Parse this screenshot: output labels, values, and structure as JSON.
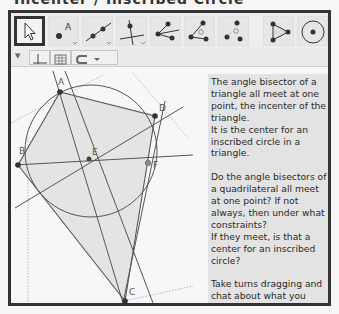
{
  "title": "Incenter / Inscribed Circle",
  "toolbar": {
    "tools": [
      {
        "name": "move-tool",
        "selected": true
      },
      {
        "name": "point-tool",
        "label": "A"
      },
      {
        "name": "line-tool"
      },
      {
        "name": "perpendicular-line-tool"
      },
      {
        "name": "segment-from-point-tool"
      },
      {
        "name": "angle-bisector-tool"
      },
      {
        "name": "angle-tool"
      },
      {
        "name": "polygon-tool"
      },
      {
        "name": "circle-tool"
      }
    ]
  },
  "stylebar": {
    "buttons": [
      "axes-toggle",
      "grid-toggle",
      "point-capture-dropdown"
    ]
  },
  "graphics": {
    "points": [
      {
        "label": "A"
      },
      {
        "label": "B"
      },
      {
        "label": "C"
      },
      {
        "label": "D"
      },
      {
        "label": "E"
      },
      {
        "label": "F"
      }
    ]
  },
  "textbox": {
    "paragraph1": "The angle bisector of a triangle all meet at one point, the incenter of the triangle.\nIt is the center for an inscribed circle in a triangle.",
    "paragraph2": "Do the angle bisectors of a quadrilateral all meet at one point? If not always, then under what constraints?\nIf they meet, is that a center for an inscribed circle?",
    "paragraph3": "Take turns dragging and chat about what you notice and wonder."
  },
  "colors": {
    "frame_border": "#333333",
    "textbox_bg": "#e3e3e3",
    "polygon_fill": "#e4e4e4",
    "line": "#555555"
  }
}
